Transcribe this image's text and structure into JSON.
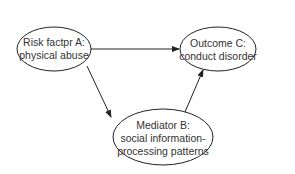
{
  "diagram": {
    "type": "mediation-path-diagram",
    "nodes": {
      "risk_factor": {
        "line1": "Risk factpr A:",
        "line2": "physical abuse"
      },
      "outcome": {
        "line1": "Outcome C:",
        "line2": "conduct disorder"
      },
      "mediator": {
        "line1": "Mediator B:",
        "line2": "social information-",
        "line3": "processing patterns"
      }
    },
    "edges": [
      {
        "from": "risk_factor",
        "to": "outcome"
      },
      {
        "from": "risk_factor",
        "to": "mediator"
      },
      {
        "from": "mediator",
        "to": "outcome"
      }
    ],
    "colors": {
      "stroke": "#222222",
      "text": "#333333",
      "background": "#ffffff"
    }
  }
}
